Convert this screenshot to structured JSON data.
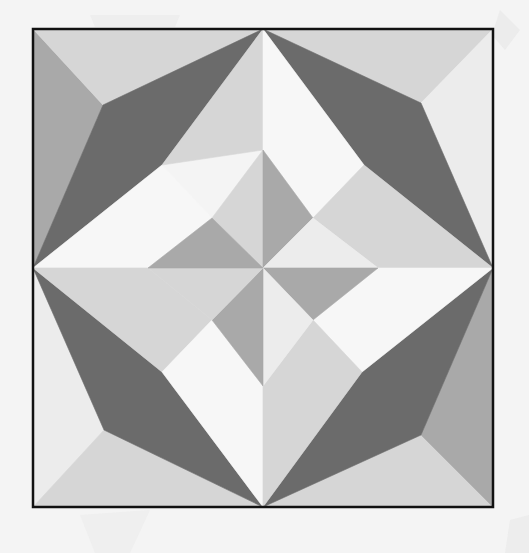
{
  "image": {
    "subject": "Quilt block pattern",
    "description": "Grayscale geometric quilt block with pinwheel center and four dark kites"
  },
  "palette": {
    "background": "#f4f4f4",
    "frame": "#111111",
    "dark": "#6b6b6b",
    "medium": "#a9a9a9",
    "light": "#d6d6d6",
    "lightest": "#ececec",
    "white": "#f7f7f7"
  },
  "block": {
    "x": 33,
    "y": 29,
    "width": 460,
    "height": 478,
    "center": [
      263,
      268
    ]
  },
  "shapes": [
    {
      "name": "top-left-corner-medium",
      "fill": "medium",
      "points": "33,29 33,268 103,105"
    },
    {
      "name": "top-left-corner-light",
      "fill": "light",
      "points": "33,29 263,29 103,105"
    },
    {
      "name": "top-left-dark-kite",
      "fill": "dark",
      "points": "33,268 103,105 263,29 162,165"
    },
    {
      "name": "top-left-white",
      "fill": "white",
      "points": "33,268 162,165 212,218 148,268"
    },
    {
      "name": "top-left-inner-light",
      "fill": "light",
      "points": "162,165 263,29 263,150"
    },
    {
      "name": "top-right-corner-light",
      "fill": "light",
      "points": "263,29 493,29 421,103"
    },
    {
      "name": "top-right-corner-lightest",
      "fill": "lightest",
      "points": "493,29 493,268 421,103"
    },
    {
      "name": "top-right-dark-kite",
      "fill": "dark",
      "points": "263,29 421,103 493,268 364,165"
    },
    {
      "name": "top-right-white",
      "fill": "white",
      "points": "263,29 364,165 313,218 263,150"
    },
    {
      "name": "top-right-inner-light",
      "fill": "light",
      "points": "364,165 493,268 378,268 313,218"
    },
    {
      "name": "bottom-left-corner-lightest",
      "fill": "lightest",
      "points": "33,268 33,507 104,430"
    },
    {
      "name": "bottom-left-corner-light",
      "fill": "light",
      "points": "33,507 263,507 104,430"
    },
    {
      "name": "bottom-left-dark-kite",
      "fill": "dark",
      "points": "33,268 162,372 263,507 104,430"
    },
    {
      "name": "bottom-left-inner-light",
      "fill": "light",
      "points": "33,268 148,268 212,320 162,372"
    },
    {
      "name": "bottom-left-white",
      "fill": "white",
      "points": "162,372 212,320 263,386 263,507"
    },
    {
      "name": "bottom-right-corner-light",
      "fill": "light",
      "points": "263,507 493,507 421,435"
    },
    {
      "name": "bottom-right-corner-medium",
      "fill": "medium",
      "points": "493,268 493,507 421,435"
    },
    {
      "name": "bottom-right-dark-kite",
      "fill": "dark",
      "points": "263,507 362,372 493,268 421,435"
    },
    {
      "name": "bottom-right-white",
      "fill": "white",
      "points": "493,268 362,372 313,320 378,268"
    },
    {
      "name": "bottom-right-inner-light",
      "fill": "light",
      "points": "263,507 263,386 313,320 362,372"
    },
    {
      "name": "pinwheel-light-nw",
      "fill": "light",
      "points": "212,218 263,150 263,268"
    },
    {
      "name": "pinwheel-medium-n",
      "fill": "medium",
      "points": "263,150 313,218 263,268"
    },
    {
      "name": "pinwheel-light-ne",
      "fill": "lightest",
      "points": "313,218 378,268 263,268"
    },
    {
      "name": "pinwheel-medium-e",
      "fill": "medium",
      "points": "378,268 313,320 263,268"
    },
    {
      "name": "pinwheel-light-se",
      "fill": "lightest",
      "points": "313,320 263,386 263,268"
    },
    {
      "name": "pinwheel-medium-s",
      "fill": "medium",
      "points": "263,386 212,320 263,268"
    },
    {
      "name": "pinwheel-light-sw",
      "fill": "light",
      "points": "212,320 148,268 263,268"
    },
    {
      "name": "pinwheel-medium-w",
      "fill": "medium",
      "points": "148,268 212,218 263,268"
    }
  ]
}
